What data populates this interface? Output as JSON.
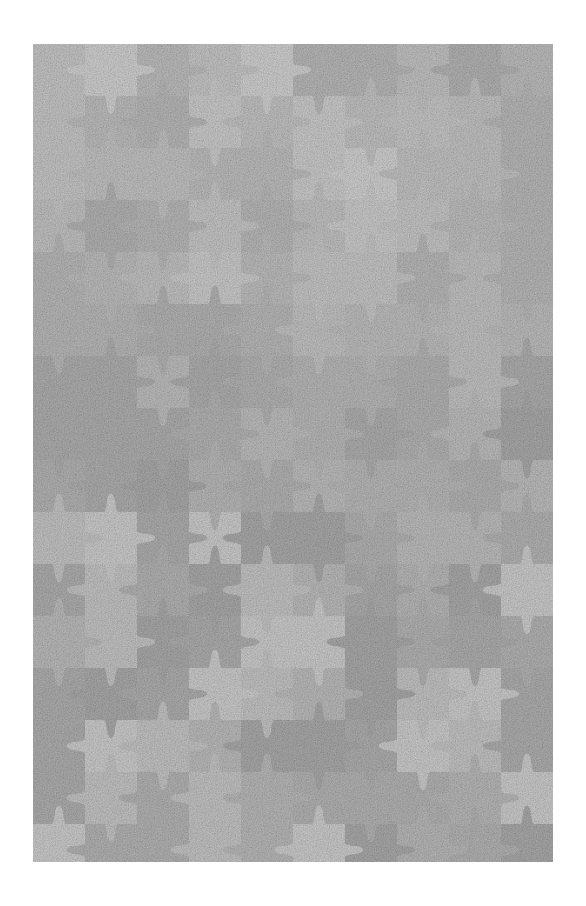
{
  "canvas": {
    "width": 586,
    "height": 906,
    "background_color": "#ffffff"
  },
  "artwork": {
    "title": "Jigsaw Puzzle Pattern",
    "description": "Seamless grayscale interlocking jigsaw puzzle piece tiling",
    "subject": "puzzle-piece-tiling"
  },
  "puzzle": {
    "origin_x": 33,
    "origin_y": 44,
    "width": 520,
    "height": 818,
    "cell_size": 52,
    "columns": 10,
    "rows": 16,
    "tab_radius_ratio": 0.17,
    "tab_neck_ratio": 0.1,
    "piece_edge_softness": 0.4,
    "base_color": "#c4c4c4",
    "palette": [
      "#d4d4d4",
      "#cfcfcf",
      "#cacaca",
      "#c6c6c6",
      "#c1c1c1",
      "#bcbcbc",
      "#b7b7b7",
      "#b2b2b2",
      "#adadad",
      "#d0d0d0",
      "#c8c8c8",
      "#bfbfbf"
    ],
    "tone_seed": 20250411,
    "tab_seed": 73516,
    "grain_opacity": 0.5,
    "grain_color": "#9a9a9a"
  }
}
